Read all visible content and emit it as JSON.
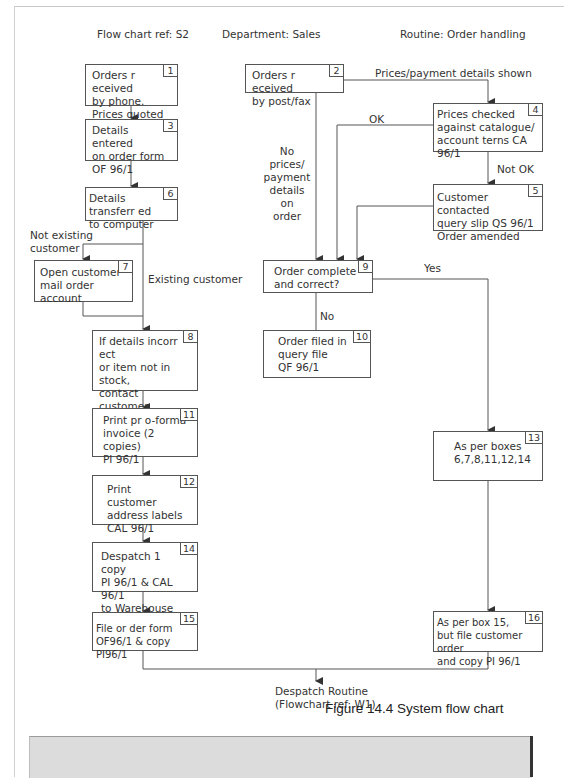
{
  "header": {
    "flowchart_ref": "Flow chart ref: S2",
    "department": "Department: Sales",
    "routine": "Routine: Order handling"
  },
  "boxes": {
    "b1": {
      "num": "1",
      "text": "Orders r eceived\nby phone.\nPrices quoted"
    },
    "b2": {
      "num": "2",
      "text": "Orders r eceived\nby post/fax"
    },
    "b3": {
      "num": "3",
      "text": "Details entered\non order form\nOF 96/1"
    },
    "b4": {
      "num": "4",
      "text": "Prices checked\nagainst catalogue/\naccount terns CA 96/1"
    },
    "b5": {
      "num": "5",
      "text": "Customer contacted\nquery slip QS 96/1\nOrder amended"
    },
    "b6": {
      "num": "6",
      "text": "Details transferr ed\nto computer"
    },
    "b7": {
      "num": "7",
      "text": "Open customer\nmail order account"
    },
    "b8": {
      "num": "8",
      "text": "If details incorr ect\nor item not in stock,\ncontact customer\nfor instructions"
    },
    "b9": {
      "num": "9",
      "text": "Order complete\nand correct?"
    },
    "b10": {
      "num": "10",
      "text": "Order filed in\nquery file\nQF 96/1"
    },
    "b11": {
      "num": "11",
      "text": "Print pr o-forma\ninvoice (2 copies)\nPI 96/1"
    },
    "b12": {
      "num": "12",
      "text": "Print customer\naddress labels\nCAL 96/1"
    },
    "b13": {
      "num": "13",
      "text": "As per boxes\n6,7,8,11,12,14"
    },
    "b14": {
      "num": "14",
      "text": "Despatch 1 copy\nPI 96/1 & CAL 96/1\nto Warehouse"
    },
    "b15": {
      "num": "15",
      "text": "File or der form\nOF96/1 & copy PI96/1"
    },
    "b16": {
      "num": "16",
      "text": "As per box 15,\nbut file customer order\nand copy PI 96/1"
    }
  },
  "labels": {
    "prices_shown": "Prices/payment details shown",
    "ok": "OK",
    "not_ok": "Not OK",
    "no_prices": "No prices/\npayment\ndetails\non\norder",
    "not_existing": "Not existing\ncustomer",
    "existing": "Existing customer",
    "yes": "Yes",
    "no": "No",
    "despatch": "Despatch Routine\n(Flowchart ref: W1)"
  },
  "caption": "Figure 14.4 System flow chart",
  "colors": {
    "line": "#555555",
    "band": "#dcdcdc"
  }
}
